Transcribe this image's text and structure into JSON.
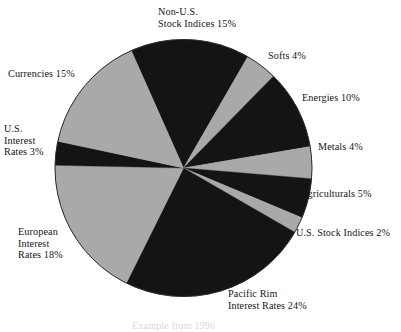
{
  "chart_data": {
    "type": "pie",
    "title": "",
    "subtitle": "",
    "xlabel": "",
    "ylabel": "",
    "legend_position": "none",
    "grid": false,
    "units": "percent",
    "total": 100,
    "start_angle_deg": -24,
    "direction": "clockwise",
    "colors": {
      "dark": "#141414",
      "light": "#a9a9a9",
      "background": "#ffffff",
      "text": "#161616",
      "outline": "#2b2b2b"
    },
    "categories": [
      "Non-U.S. Stock Indices",
      "Softs",
      "Energies",
      "Metals",
      "Agriculturals",
      "U.S. Stock Indices",
      "Pacific Rim Interest Rates",
      "European Interest Rates",
      "U.S. Interest Rates",
      "Currencies"
    ],
    "values": [
      15,
      4,
      10,
      4,
      5,
      2,
      24,
      18,
      3,
      15
    ],
    "slices": [
      {
        "name": "Non-U.S. Stock Indices",
        "value": 15,
        "fill": "dark",
        "label_lines": [
          "Non-U.S.",
          "Stock Indices 15%"
        ]
      },
      {
        "name": "Softs",
        "value": 4,
        "fill": "light",
        "label_lines": [
          "Softs 4%"
        ]
      },
      {
        "name": "Energies",
        "value": 10,
        "fill": "dark",
        "label_lines": [
          "Energies 10%"
        ]
      },
      {
        "name": "Metals",
        "value": 4,
        "fill": "light",
        "label_lines": [
          "Metals 4%"
        ]
      },
      {
        "name": "Agriculturals",
        "value": 5,
        "fill": "dark",
        "label_lines": [
          "Agriculturals 5%"
        ]
      },
      {
        "name": "U.S. Stock Indices",
        "value": 2,
        "fill": "light",
        "label_lines": [
          "U.S. Stock Indices 2%"
        ]
      },
      {
        "name": "Pacific Rim Interest Rates",
        "value": 24,
        "fill": "dark",
        "label_lines": [
          "Pacific Rim",
          "Interest Rates 24%"
        ]
      },
      {
        "name": "European Interest Rates",
        "value": 18,
        "fill": "light",
        "label_lines": [
          "European",
          "Interest",
          "Rates 18%"
        ]
      },
      {
        "name": "U.S. Interest Rates",
        "value": 3,
        "fill": "dark",
        "label_lines": [
          "U.S.",
          "Interest",
          "Rates 3%"
        ]
      },
      {
        "name": "Currencies",
        "value": 15,
        "fill": "light",
        "label_lines": [
          "Currencies 15%"
        ]
      }
    ]
  },
  "labels": {
    "non_us_stock_indices": "Non-U.S.\nStock Indices 15%",
    "softs": "Softs 4%",
    "energies": "Energies 10%",
    "metals": "Metals 4%",
    "agriculturals": "Agriculturals 5%",
    "us_stock_indices": "U.S. Stock Indices 2%",
    "pacific_rim_interest_rates": "Pacific Rim\nInterest Rates 24%",
    "european_interest_rates": "European\nInterest\nRates 18%",
    "us_interest_rates": "U.S.\nInterest\nRates 3%",
    "currencies": "Currencies 15%",
    "bottom_caption": "Example from 1996"
  }
}
